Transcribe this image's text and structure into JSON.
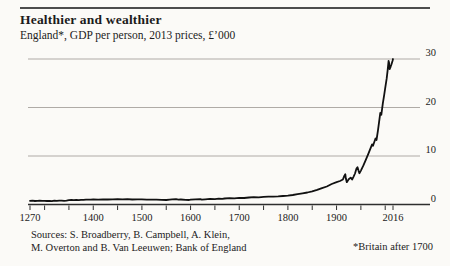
{
  "header": {
    "title": "Healthier and wealthier",
    "subtitle": "England*, GDP per person, 2013 prices, £’000"
  },
  "footer": {
    "sources_line1": "Sources: S. Broadberry, B. Campbell, A. Klein,",
    "sources_line2": "M. Overton and B. Van Leeuwen; Bank of England",
    "footnote": "*Britain after 1700"
  },
  "colors": {
    "background": "#fbfaf7",
    "text": "#1b1b1b",
    "grid": "#a6a29c",
    "axis": "#2e2e2e",
    "line": "#111111",
    "rule": "#4c4c4c"
  },
  "chart_data": {
    "type": "line",
    "title": "Healthier and wealthier",
    "subtitle": "England*, GDP per person, 2013 prices, £’000",
    "xlabel": "Year",
    "ylabel": "GDP per person, £’000 (2013 prices)",
    "xlim": [
      1270,
      2016
    ],
    "ylim": [
      0,
      30
    ],
    "grid": "horizontal-only",
    "y_labels_position": "right",
    "legend": "none",
    "y_ticks": [
      0,
      10,
      20,
      30
    ],
    "x_tick_labels": [
      {
        "year": 1270,
        "label": "1270"
      },
      {
        "year": 1400,
        "label": "1400"
      },
      {
        "year": 1500,
        "label": "1500"
      },
      {
        "year": 1600,
        "label": "1600"
      },
      {
        "year": 1700,
        "label": "1700"
      },
      {
        "year": 1800,
        "label": "1800"
      },
      {
        "year": 1900,
        "label": "1900"
      },
      {
        "year": 2016,
        "label": "2016"
      }
    ],
    "x_minor_tick_years": [
      1270,
      1300,
      1350,
      1400,
      1450,
      1500,
      1550,
      1600,
      1650,
      1700,
      1750,
      1800,
      1850,
      1900,
      1950,
      2000,
      2016
    ],
    "series": [
      {
        "name": "England/Britain GDP per person (£'000, 2013 prices)",
        "points": [
          [
            1270,
            0.75
          ],
          [
            1275,
            0.78
          ],
          [
            1280,
            0.73
          ],
          [
            1285,
            0.77
          ],
          [
            1290,
            0.81
          ],
          [
            1295,
            0.74
          ],
          [
            1300,
            0.77
          ],
          [
            1305,
            0.73
          ],
          [
            1310,
            0.76
          ],
          [
            1315,
            0.7
          ],
          [
            1320,
            0.79
          ],
          [
            1325,
            0.75
          ],
          [
            1330,
            0.78
          ],
          [
            1335,
            0.81
          ],
          [
            1340,
            0.77
          ],
          [
            1345,
            0.81
          ],
          [
            1350,
            0.9
          ],
          [
            1355,
            0.94
          ],
          [
            1360,
            0.9
          ],
          [
            1365,
            0.95
          ],
          [
            1370,
            0.91
          ],
          [
            1375,
            0.97
          ],
          [
            1380,
            0.94
          ],
          [
            1385,
            0.99
          ],
          [
            1390,
            1.01
          ],
          [
            1395,
            0.98
          ],
          [
            1400,
            1.04
          ],
          [
            1410,
            1.01
          ],
          [
            1420,
            1.06
          ],
          [
            1430,
            1.03
          ],
          [
            1440,
            1.08
          ],
          [
            1450,
            1.1
          ],
          [
            1460,
            1.06
          ],
          [
            1470,
            1.09
          ],
          [
            1480,
            1.04
          ],
          [
            1490,
            1.07
          ],
          [
            1500,
            1.05
          ],
          [
            1510,
            1.01
          ],
          [
            1520,
            0.98
          ],
          [
            1530,
            1.01
          ],
          [
            1540,
            0.97
          ],
          [
            1550,
            0.93
          ],
          [
            1557,
            1.02
          ],
          [
            1562,
            1.06
          ],
          [
            1570,
            1.09
          ],
          [
            1575,
            0.99
          ],
          [
            1580,
            1.04
          ],
          [
            1590,
            0.97
          ],
          [
            1597,
            0.93
          ],
          [
            1600,
            1.01
          ],
          [
            1610,
            1.05
          ],
          [
            1620,
            1.09
          ],
          [
            1623,
            0.99
          ],
          [
            1630,
            1.07
          ],
          [
            1640,
            1.15
          ],
          [
            1650,
            1.11
          ],
          [
            1658,
            1.19
          ],
          [
            1665,
            1.15
          ],
          [
            1670,
            1.23
          ],
          [
            1680,
            1.29
          ],
          [
            1690,
            1.25
          ],
          [
            1700,
            1.37
          ],
          [
            1710,
            1.33
          ],
          [
            1720,
            1.45
          ],
          [
            1730,
            1.51
          ],
          [
            1740,
            1.47
          ],
          [
            1750,
            1.57
          ],
          [
            1760,
            1.61
          ],
          [
            1770,
            1.63
          ],
          [
            1780,
            1.67
          ],
          [
            1790,
            1.75
          ],
          [
            1800,
            1.83
          ],
          [
            1810,
            1.95
          ],
          [
            1820,
            2.12
          ],
          [
            1830,
            2.3
          ],
          [
            1840,
            2.48
          ],
          [
            1850,
            2.72
          ],
          [
            1860,
            3.02
          ],
          [
            1870,
            3.38
          ],
          [
            1880,
            3.72
          ],
          [
            1890,
            4.22
          ],
          [
            1900,
            4.62
          ],
          [
            1907,
            4.85
          ],
          [
            1913,
            5.15
          ],
          [
            1916,
            5.9
          ],
          [
            1918,
            6.25
          ],
          [
            1919,
            5.4
          ],
          [
            1921,
            4.6
          ],
          [
            1925,
            5.2
          ],
          [
            1929,
            5.55
          ],
          [
            1932,
            5.15
          ],
          [
            1935,
            5.75
          ],
          [
            1938,
            6.4
          ],
          [
            1941,
            7.4
          ],
          [
            1943,
            7.7
          ],
          [
            1945,
            7.0
          ],
          [
            1947,
            6.45
          ],
          [
            1950,
            7.0
          ],
          [
            1955,
            8.0
          ],
          [
            1960,
            9.2
          ],
          [
            1965,
            10.4
          ],
          [
            1970,
            11.6
          ],
          [
            1973,
            12.4
          ],
          [
            1975,
            12.1
          ],
          [
            1980,
            13.6
          ],
          [
            1982,
            13.3
          ],
          [
            1985,
            15.2
          ],
          [
            1988,
            17.5
          ],
          [
            1990,
            18.9
          ],
          [
            1992,
            18.5
          ],
          [
            1995,
            20.8
          ],
          [
            1998,
            22.6
          ],
          [
            2000,
            24.0
          ],
          [
            2003,
            26.0
          ],
          [
            2005,
            27.6
          ],
          [
            2007,
            29.6
          ],
          [
            2008,
            29.2
          ],
          [
            2009,
            27.9
          ],
          [
            2011,
            28.4
          ],
          [
            2013,
            28.9
          ],
          [
            2015,
            29.6
          ],
          [
            2016,
            30.0
          ]
        ]
      }
    ]
  }
}
